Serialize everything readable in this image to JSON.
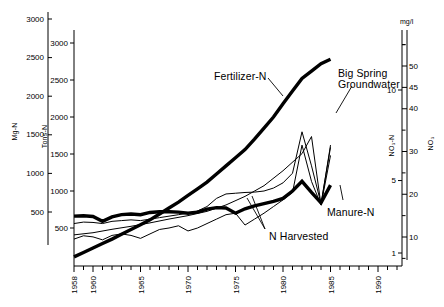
{
  "figure": {
    "width": 444,
    "height": 307,
    "background": "#ffffff",
    "line_color": "#000000"
  },
  "axes": {
    "left_outer": {
      "name": "Mg-N",
      "title": "Mg-N",
      "ticks": [
        500,
        1000,
        1500,
        2000,
        2500,
        3000
      ],
      "tick_labels": [
        "500",
        "1000",
        "1500",
        "2000",
        "2500",
        "3000"
      ],
      "range": [
        0,
        3000
      ]
    },
    "left_inner": {
      "name": "Tons-N",
      "title": "Tons-N",
      "ticks": [
        500,
        1000,
        1500,
        2000,
        2500,
        3000
      ],
      "tick_labels": [
        "500",
        "1000",
        "1500",
        "2000",
        "2500",
        "3000"
      ],
      "range": [
        0,
        3000
      ]
    },
    "right_inner": {
      "name": "NO3-N",
      "title": "NO₃-N",
      "ticks": [
        1,
        5,
        10
      ],
      "tick_labels": [
        "1",
        "5",
        "10"
      ],
      "range": [
        0,
        12
      ]
    },
    "right_outer": {
      "name": "NO3",
      "title": "NO₃",
      "unit": "mg/l",
      "ticks": [
        10,
        20,
        30,
        40,
        45,
        50
      ],
      "tick_labels": [
        "10",
        "20",
        "30",
        "40",
        "45",
        "50"
      ],
      "range": [
        0,
        55
      ]
    },
    "x": {
      "name": "year",
      "major_ticks": [
        1958,
        1960,
        1965,
        1970,
        1975,
        1980,
        1985,
        1990
      ],
      "major_tick_labels": [
        "1958",
        "1960",
        "1965",
        "1970",
        "1975",
        "1980",
        "1985",
        "1990"
      ],
      "minor_tick_interval": 1,
      "range": [
        1958,
        1992
      ]
    }
  },
  "annotations": [
    {
      "id": "fertilizer",
      "text": "Fertilizer-N",
      "x": 214,
      "y": 71
    },
    {
      "id": "big-spring",
      "line1": "Big Spring",
      "line2": "Groundwater",
      "x": 338,
      "y": 68
    },
    {
      "id": "manure",
      "text": "Manure-N",
      "x": 327,
      "y": 207
    },
    {
      "id": "n-harvested",
      "text": "N Harvested",
      "x": 269,
      "y": 231
    }
  ],
  "chart_data": {
    "type": "line",
    "title": "",
    "xlabel": "",
    "ylabel": "Mg-N / Tons-N",
    "xlim": [
      1958,
      1992
    ],
    "ylim": [
      0,
      3000
    ],
    "y2label": "NO₃-N / NO₃ (mg/l)",
    "y2lim": [
      0,
      55
    ],
    "grid": false,
    "legend": "inline-annotations",
    "series": [
      {
        "name": "Fertilizer-N",
        "style": "thick",
        "axis": "left",
        "x": [
          1958,
          1959,
          1960,
          1961,
          1962,
          1963,
          1964,
          1965,
          1966,
          1967,
          1968,
          1969,
          1970,
          1971,
          1972,
          1973,
          1974,
          1975,
          1976,
          1977,
          1978,
          1979,
          1980,
          1981,
          1982,
          1983,
          1984,
          1985
        ],
        "values": [
          110,
          170,
          230,
          290,
          350,
          415,
          480,
          545,
          610,
          690,
          770,
          850,
          940,
          1030,
          1120,
          1230,
          1340,
          1450,
          1560,
          1700,
          1850,
          2000,
          2180,
          2350,
          2520,
          2620,
          2720,
          2780
        ]
      },
      {
        "name": "Manure-N",
        "style": "thick",
        "axis": "left",
        "x": [
          1958,
          1959,
          1960,
          1961,
          1962,
          1963,
          1964,
          1965,
          1966,
          1967,
          1968,
          1969,
          1970,
          1971,
          1972,
          1973,
          1974,
          1975,
          1976,
          1977,
          1978,
          1979,
          1980,
          1981,
          1982,
          1983,
          1984,
          1985
        ],
        "values": [
          660,
          665,
          655,
          590,
          650,
          680,
          690,
          680,
          710,
          720,
          720,
          715,
          700,
          715,
          755,
          775,
          770,
          700,
          760,
          800,
          830,
          860,
          900,
          1000,
          1130,
          980,
          840,
          1080
        ]
      },
      {
        "name": "Big Spring Groundwater",
        "style": "thin",
        "axis": "right",
        "x": [
          1958,
          1960,
          1962,
          1964,
          1966,
          1968,
          1970,
          1972,
          1974,
          1976,
          1978,
          1980,
          1982,
          1983,
          1984,
          1985
        ],
        "values": [
          10.5,
          11.0,
          11.8,
          12.5,
          13.3,
          14.2,
          15.0,
          16.0,
          17.5,
          19.5,
          22.0,
          25.5,
          29.5,
          33.5,
          17.5,
          31.5
        ]
      },
      {
        "name": "N Harvested",
        "style": "thin",
        "axis": "left",
        "x": [
          1958,
          1959,
          1960,
          1961,
          1962,
          1963,
          1964,
          1965,
          1966,
          1967,
          1968,
          1969,
          1970,
          1971,
          1972,
          1973,
          1974,
          1975,
          1976,
          1977,
          1978,
          1979,
          1980,
          1981,
          1982,
          1983,
          1984,
          1985
        ],
        "values": [
          560,
          580,
          575,
          560,
          590,
          600,
          610,
          600,
          620,
          640,
          660,
          680,
          700,
          730,
          790,
          900,
          960,
          970,
          980,
          985,
          1000,
          1040,
          1110,
          1240,
          1800,
          1340,
          830,
          1590
        ]
      },
      {
        "name": "N Excess",
        "style": "thin",
        "axis": "left",
        "x": [
          1958,
          1959,
          1960,
          1961,
          1962,
          1963,
          1964,
          1965,
          1966,
          1967,
          1968,
          1969,
          1970,
          1971,
          1972,
          1973,
          1974,
          1975,
          1976,
          1977,
          1978,
          1979,
          1980,
          1981,
          1982,
          1983,
          1984,
          1985
        ],
        "values": [
          350,
          395,
          380,
          340,
          400,
          420,
          400,
          360,
          420,
          480,
          500,
          530,
          460,
          500,
          560,
          620,
          680,
          700,
          540,
          620,
          700,
          790,
          880,
          980,
          1620,
          1130,
          810,
          1480
        ]
      }
    ]
  }
}
